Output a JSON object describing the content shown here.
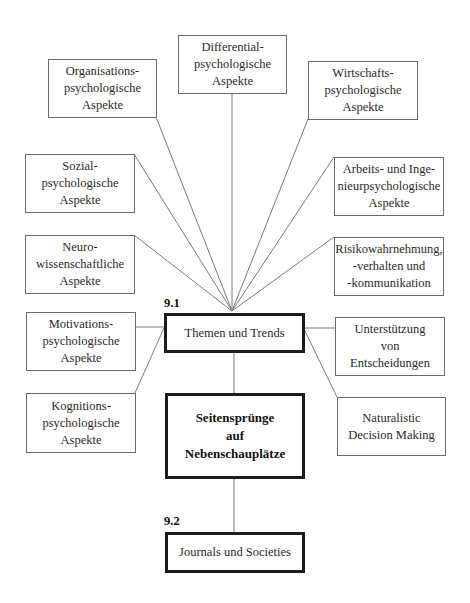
{
  "diagram": {
    "sections": [
      {
        "number": "9.1",
        "title": "Themen und Trends"
      },
      {
        "number": "9.2",
        "title": "Journals und Societies"
      }
    ],
    "center": {
      "lines": [
        "Seitensprünge",
        "auf",
        "Nebenschauplätze"
      ]
    },
    "topics": {
      "differential": {
        "lines": [
          "Differential-",
          "psychologische",
          "Aspekte"
        ]
      },
      "organisation": {
        "lines": [
          "Organisations-",
          "psychologische",
          "Aspekte"
        ]
      },
      "wirtschaft": {
        "lines": [
          "Wirtschafts-",
          "psychologische",
          "Aspekte"
        ]
      },
      "sozial": {
        "lines": [
          "Sozial-",
          "psychologische",
          "Aspekte"
        ]
      },
      "arbeit": {
        "lines": [
          "Arbeits- und Inge-",
          "nieurpsychologische",
          "Aspekte"
        ]
      },
      "neuro": {
        "lines": [
          "Neuro-",
          "wissenschaftliche",
          "Aspekte"
        ]
      },
      "risiko": {
        "lines": [
          "Risikowahrnehmung,",
          "-verhalten und",
          "-kommunikation"
        ]
      },
      "motivation": {
        "lines": [
          "Motivations-",
          "psychologische",
          "Aspekte"
        ]
      },
      "unterstuetzung": {
        "lines": [
          "Unterstützung",
          "von",
          "Entscheidungen"
        ]
      },
      "kognition": {
        "lines": [
          "Kognitions-",
          "psychologische",
          "Aspekte"
        ]
      },
      "naturalistic": {
        "lines": [
          "Naturalistic",
          "Decision Making"
        ]
      }
    },
    "colors": {
      "line": "#6a6a6a",
      "thick_border": "#1c1c1c",
      "text": "#2a2a2a"
    }
  }
}
